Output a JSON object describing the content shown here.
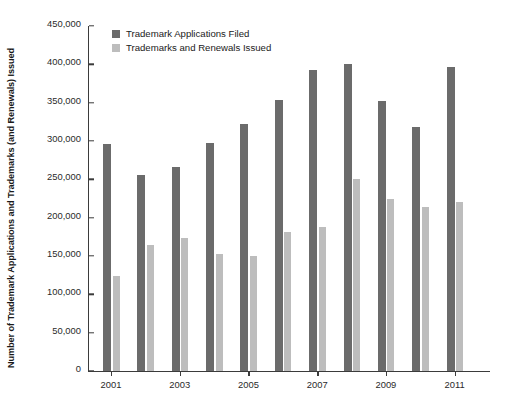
{
  "chart_data": {
    "type": "bar",
    "title": "",
    "xlabel": "",
    "ylabel": "Number of Trademark Applications and Trademarks (and Renewals) Issued",
    "ylim": [
      0,
      450000
    ],
    "ytick_step": 50000,
    "ytick_labels": [
      "450,000",
      "400,000",
      "350,000",
      "300,000",
      "250,000",
      "200,000",
      "150,000",
      "100,000",
      "50,000",
      "0"
    ],
    "ytick_values": [
      450000,
      400000,
      350000,
      300000,
      250000,
      200000,
      150000,
      100000,
      50000,
      0
    ],
    "grid": false,
    "legend_position": "top-left",
    "categories": [
      "2001",
      "2002",
      "2003",
      "2004",
      "2005",
      "2006",
      "2007",
      "2008",
      "2009",
      "2010",
      "2011"
    ],
    "xtick_labels": [
      "2001",
      "2003",
      "2005",
      "2007",
      "2009",
      "2011"
    ],
    "series": [
      {
        "name": "Trademark Applications Filed",
        "color": "#6b6b6b",
        "values": [
          296000,
          256000,
          266000,
          297000,
          322000,
          353000,
          393000,
          401000,
          352000,
          318000,
          397000
        ]
      },
      {
        "name": "Trademarks and Renewals Issued",
        "color": "#bdbdbd",
        "values": [
          124000,
          164000,
          174000,
          152000,
          150000,
          181000,
          188000,
          251000,
          224000,
          214000,
          221000
        ]
      }
    ]
  },
  "axis": {
    "line_color": "#3b3b3b"
  }
}
